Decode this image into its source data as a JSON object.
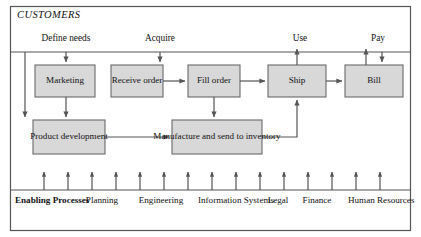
{
  "diagram": {
    "title": "CUSTOMERS",
    "colors": {
      "box_fill": "#d8d8d8",
      "box_stroke": "#6a6a6a",
      "frame_stroke": "#555555",
      "line": "#555555",
      "text": "#111111",
      "background": "#ffffff"
    },
    "customer_activities": [
      {
        "label": "Define needs",
        "x": 66,
        "y": 40
      },
      {
        "label": "Acquire",
        "x": 160,
        "y": 40
      },
      {
        "label": "Use",
        "x": 300,
        "y": 40
      },
      {
        "label": "Pay",
        "x": 378,
        "y": 40
      }
    ],
    "process_boxes": [
      {
        "id": "marketing",
        "label": "Marketing",
        "x": 35,
        "y": 65,
        "w": 60,
        "h": 32
      },
      {
        "id": "receive-order",
        "label": "Receive order",
        "x": 111,
        "y": 65,
        "w": 52,
        "h": 32
      },
      {
        "id": "fill-order",
        "label": "Fill order",
        "x": 188,
        "y": 65,
        "w": 52,
        "h": 32
      },
      {
        "id": "ship",
        "label": "Ship",
        "x": 268,
        "y": 65,
        "w": 58,
        "h": 32
      },
      {
        "id": "bill",
        "label": "Bill",
        "x": 345,
        "y": 65,
        "w": 58,
        "h": 32
      },
      {
        "id": "product-development",
        "label": "Product development",
        "x": 33,
        "y": 120,
        "w": 72,
        "h": 34
      },
      {
        "id": "manufacture-inventory",
        "label": "Manufacture and send to inventory",
        "x": 172,
        "y": 120,
        "w": 90,
        "h": 34
      }
    ],
    "enabling_processes": [
      {
        "label": "Enabling Processes",
        "bold": true,
        "x": 45,
        "y": 199
      },
      {
        "label": "Planning",
        "bold": false,
        "x": 101,
        "y": 199
      },
      {
        "label": "Engineering",
        "bold": false,
        "x": 161,
        "y": 199
      },
      {
        "label": "Information Systems",
        "bold": false,
        "x": 229,
        "y": 199
      },
      {
        "label": "Legal",
        "bold": false,
        "x": 277,
        "y": 199
      },
      {
        "label": "Finance",
        "bold": false,
        "x": 316,
        "y": 199
      },
      {
        "label": "Human Resources",
        "bold": false,
        "x": 376,
        "y": 199
      }
    ],
    "enabling_arrow_x": [
      44,
      68,
      92,
      116,
      140,
      164,
      188,
      212,
      236,
      260,
      284,
      308,
      332,
      356,
      380
    ],
    "frame": {
      "x": 10,
      "y": 6,
      "w": 401,
      "h": 225
    },
    "divider_top_y": 52,
    "divider_bottom_y": 190
  }
}
